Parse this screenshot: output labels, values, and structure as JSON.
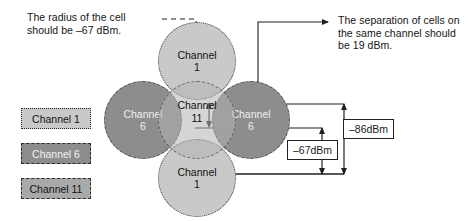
{
  "diagram": {
    "notes": {
      "radius": "The radius of the cell\nshould be –67 dBm.",
      "separation": "The separation of cells on\nthe same channel should\nbe 19 dBm."
    },
    "legend": {
      "items": [
        {
          "label": "Channel 1",
          "color": "#c9c9c9",
          "border": "dotted",
          "text_color": "#121212"
        },
        {
          "label": "Channel 6",
          "color": "#8d8d8d",
          "border": "dashed",
          "text_color": "#f2f2f2"
        },
        {
          "label": "Channel 11",
          "color": "#a9a9a9",
          "border": "dashed",
          "text_color": "#121212"
        }
      ]
    },
    "cells": [
      {
        "id": "top",
        "name": "Channel",
        "number": "1",
        "shade": "light"
      },
      {
        "id": "left",
        "name": "Channel",
        "number": "6",
        "shade": "dark"
      },
      {
        "id": "center",
        "name": "Channel",
        "number": "11",
        "shade": "mid"
      },
      {
        "id": "right",
        "name": "Channel",
        "number": "6",
        "shade": "dark"
      },
      {
        "id": "bottom",
        "name": "Channel",
        "number": "1",
        "shade": "light"
      }
    ],
    "measurements": [
      {
        "id": "outer",
        "label": "–86dBm"
      },
      {
        "id": "inner",
        "label": "–67dBm"
      }
    ]
  }
}
